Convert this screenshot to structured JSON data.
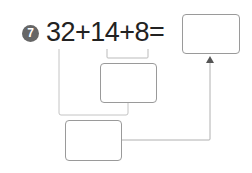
{
  "problem": {
    "number": "7",
    "expression": "32+14+8=",
    "answer_box_value": "",
    "partial_sum_box_value": "",
    "total_box_value": ""
  },
  "colors": {
    "badge": "#666666",
    "text": "#222222",
    "lines": "#bbbbbb",
    "box_border": "#9a9a9a"
  }
}
